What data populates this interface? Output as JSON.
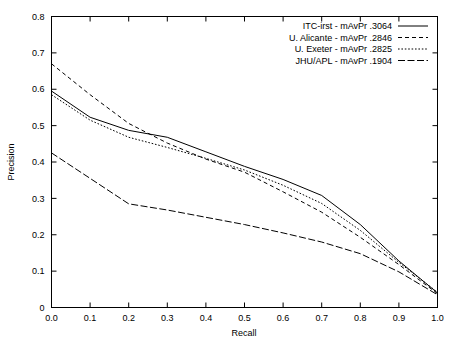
{
  "chart_data": {
    "type": "line",
    "title": "",
    "xlabel": "Recall",
    "ylabel": "Precision",
    "xlim": [
      0.0,
      1.0
    ],
    "ylim": [
      0.0,
      0.8
    ],
    "grid": false,
    "legend_position": "top-right",
    "xticks": [
      "0.0",
      "0.1",
      "0.2",
      "0.3",
      "0.4",
      "0.5",
      "0.6",
      "0.7",
      "0.8",
      "0.9",
      "1.0"
    ],
    "xtick_values": [
      0.0,
      0.1,
      0.2,
      0.3,
      0.4,
      0.5,
      0.6,
      0.7,
      0.8,
      0.9,
      1.0
    ],
    "yticks": [
      "0",
      "0.1",
      "0.2",
      "0.3",
      "0.4",
      "0.5",
      "0.6",
      "0.7",
      "0.8"
    ],
    "ytick_values": [
      0.0,
      0.1,
      0.2,
      0.3,
      0.4,
      0.5,
      0.6,
      0.7,
      0.8
    ],
    "x": [
      0.0,
      0.1,
      0.2,
      0.3,
      0.4,
      0.5,
      0.6,
      0.7,
      0.8,
      0.9,
      1.0
    ],
    "series": [
      {
        "name": "ITC-irst - mAvPr .3064",
        "system": "ITC-irst",
        "mAvPr": ".3064",
        "dash": "none",
        "values": [
          0.595,
          0.523,
          0.487,
          0.468,
          0.428,
          0.388,
          0.352,
          0.308,
          0.228,
          0.128,
          0.04
        ]
      },
      {
        "name": "U. Alicante - mAvPr .2846",
        "system": "U. Alicante",
        "mAvPr": ".2846",
        "dash": "4,3",
        "values": [
          0.67,
          0.585,
          0.506,
          0.452,
          0.408,
          0.372,
          0.318,
          0.262,
          0.193,
          0.118,
          0.038
        ]
      },
      {
        "name": "U. Exeter - mAvPr .2825",
        "system": "U. Exeter",
        "mAvPr": ".2825",
        "dash": "1.6,1.8",
        "values": [
          0.585,
          0.515,
          0.468,
          0.44,
          0.41,
          0.378,
          0.336,
          0.286,
          0.212,
          0.124,
          0.042
        ]
      },
      {
        "name": "JHU/APL - mAvPr .1904",
        "system": "JHU/APL",
        "mAvPr": ".1904",
        "dash": "7,2.5",
        "values": [
          0.425,
          0.355,
          0.285,
          0.268,
          0.248,
          0.228,
          0.205,
          0.18,
          0.148,
          0.098,
          0.035
        ]
      }
    ]
  }
}
